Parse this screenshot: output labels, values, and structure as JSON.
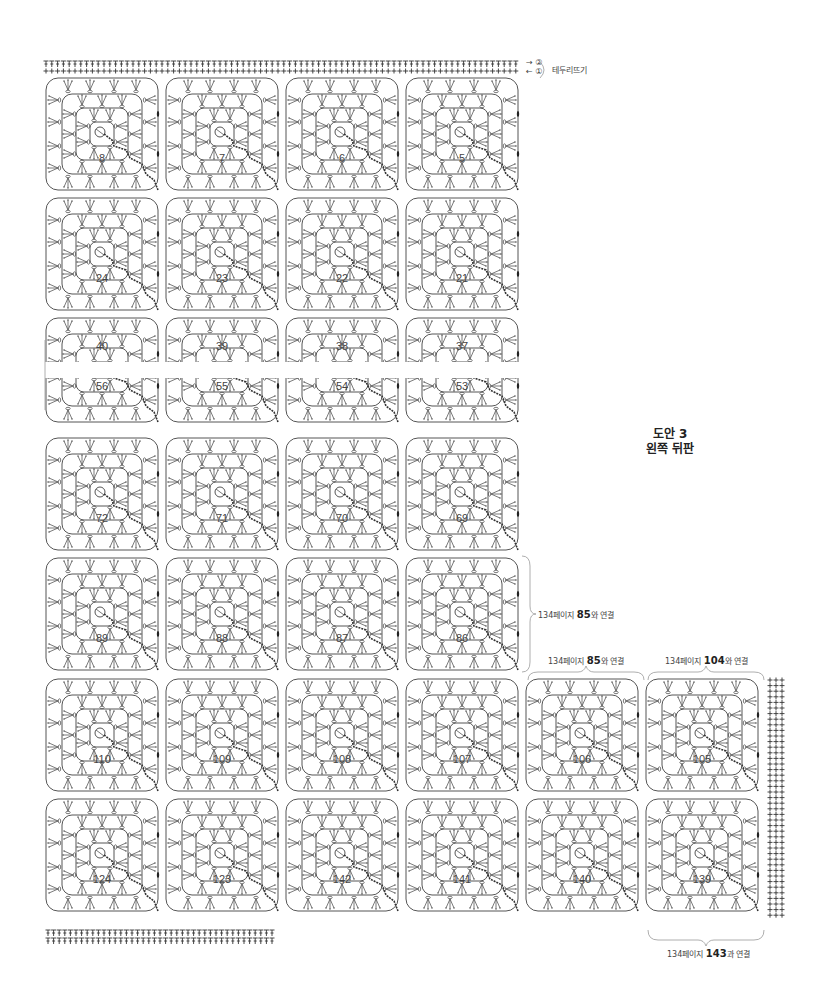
{
  "title": {
    "line1": "도안 3",
    "line2": "왼쪽 뒤판"
  },
  "edging": {
    "row2_marker": "②",
    "row1_marker": "①",
    "label": "테두리뜨기"
  },
  "connections": [
    {
      "id": "conn-right-row5",
      "prefix": "134페이지 ",
      "bold": "85",
      "suffix": "와 연결"
    },
    {
      "id": "conn-top-col5",
      "prefix": "134페이지 ",
      "bold": "85",
      "suffix": "와 연결"
    },
    {
      "id": "conn-top-col6",
      "prefix": "134페이지 ",
      "bold": "104",
      "suffix": "와 연결"
    },
    {
      "id": "conn-bottom-col6",
      "prefix": "134페이지 ",
      "bold": "143",
      "suffix": "과 연결"
    }
  ],
  "colors": {
    "line": "#555555",
    "dark_line": "#333333",
    "text": "#333333",
    "bracket": "#999999"
  },
  "grid": {
    "cell_size": 120,
    "origin_x": 42,
    "rows": [
      {
        "y": 74,
        "type": "full",
        "numbers": [
          8,
          7,
          6,
          5
        ]
      },
      {
        "y": 194,
        "type": "full",
        "numbers": [
          24,
          23,
          22,
          21
        ]
      },
      {
        "y": 314,
        "type": "half-top",
        "numbers": [
          40,
          39,
          38,
          37
        ]
      },
      {
        "y": 378,
        "type": "half-bottom",
        "numbers": [
          56,
          55,
          54,
          53
        ]
      },
      {
        "y": 434,
        "type": "full",
        "numbers": [
          72,
          71,
          70,
          69
        ]
      },
      {
        "y": 554,
        "type": "full",
        "numbers": [
          89,
          88,
          87,
          86
        ]
      },
      {
        "y": 675,
        "type": "full",
        "numbers": [
          110,
          109,
          108,
          107,
          106,
          105
        ]
      },
      {
        "y": 795,
        "type": "full",
        "numbers": [
          124,
          123,
          142,
          141,
          140,
          139
        ]
      }
    ]
  }
}
